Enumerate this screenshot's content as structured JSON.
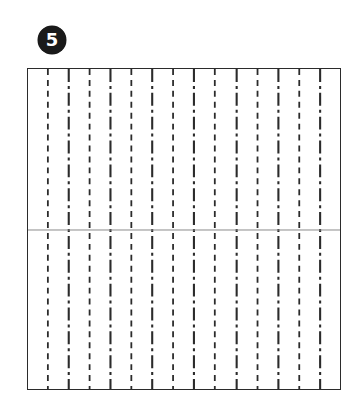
{
  "step": {
    "badge_number": "5",
    "badge_color": "#1a1a1a",
    "badge_text_color": "#ffffff"
  },
  "diagram": {
    "name": "paper-folding-instruction-diagram",
    "frame": {
      "x": 27,
      "y": 68,
      "width": 314,
      "height": 322,
      "border_color": "#2b2b2b",
      "border_width": 1.4,
      "fill": "#ffffff"
    },
    "line_colors": {
      "vertical_crease": "#2b2b2b",
      "horizontal_crease": "#8a8a8a"
    },
    "vertical_creases": [
      {
        "x": 47,
        "style": "dashed"
      },
      {
        "x": 68,
        "style": "dash-dot"
      },
      {
        "x": 89,
        "style": "dashed"
      },
      {
        "x": 110,
        "style": "dash-dot"
      },
      {
        "x": 131,
        "style": "dashed"
      },
      {
        "x": 152,
        "style": "dash-dot"
      },
      {
        "x": 173,
        "style": "dashed"
      },
      {
        "x": 194,
        "style": "dash-dot"
      },
      {
        "x": 215,
        "style": "dashed"
      },
      {
        "x": 237,
        "style": "dash-dot"
      },
      {
        "x": 258,
        "style": "dashed"
      },
      {
        "x": 279,
        "style": "dash-dot"
      },
      {
        "x": 300,
        "style": "dashed"
      },
      {
        "x": 321,
        "style": "dash-dot"
      }
    ],
    "horizontal_creases": [
      {
        "y": 230,
        "style": "solid"
      }
    ]
  }
}
